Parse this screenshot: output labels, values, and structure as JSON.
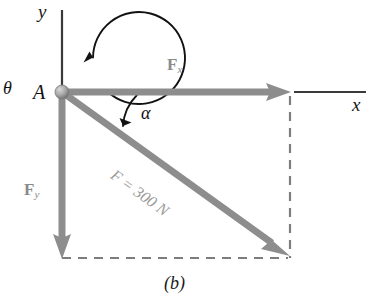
{
  "figure": {
    "caption": "(b)",
    "axes": {
      "y_label": "y",
      "x_label": "x"
    },
    "origin_point": {
      "label": "A"
    },
    "angles": [
      {
        "name": "theta",
        "symbol": "θ"
      },
      {
        "name": "alpha",
        "symbol": "α"
      }
    ],
    "vectors": [
      {
        "name": "Fx",
        "label_main": "F",
        "label_sub": "x"
      },
      {
        "name": "Fy",
        "label_main": "F",
        "label_sub": "y"
      },
      {
        "name": "F",
        "label": "F = 300 N",
        "magnitude": 300,
        "unit": "N"
      }
    ],
    "colors": {
      "vector_gray": "#8d8d8d",
      "axis_black": "#3a3a3a",
      "dashed_gray": "#7a7a7a",
      "node_gray": "#9b9b9b",
      "text_black": "#1a1a1a",
      "text_gray": "#8f8f8f",
      "background": "#ffffff"
    }
  }
}
